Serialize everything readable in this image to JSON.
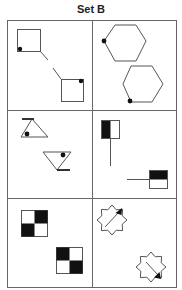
{
  "title": "Set B",
  "grid": {
    "rows": 3,
    "cols": 2
  },
  "panels": [
    {
      "id": "r1c1",
      "description": "Two squares connected by a dashed diagonal line; dot at bottom-left corner of upper square, dot at top-right corner of lower square"
    },
    {
      "id": "r1c2",
      "description": "Two hexagons; dot on left vertex of upper hexagon, dot on bottom-left vertex of lower hexagon"
    },
    {
      "id": "r2c1",
      "description": "Upright triangle with bar at top-left and dot inside; inverted triangle with bar at bottom-right and dot inside"
    },
    {
      "id": "r2c2",
      "description": "Square with left half black and a vertical line below; square with top half black and a horizontal line to the left"
    },
    {
      "id": "r3c1",
      "description": "Two 2x2 checkerboards with opposite black cell arrangement"
    },
    {
      "id": "r3c2",
      "description": "Two eight-point stars with arrows pointing to top-right and bottom-right"
    }
  ],
  "colors": {
    "stroke": "#555555",
    "fill": "#111111",
    "border": "#666666"
  }
}
